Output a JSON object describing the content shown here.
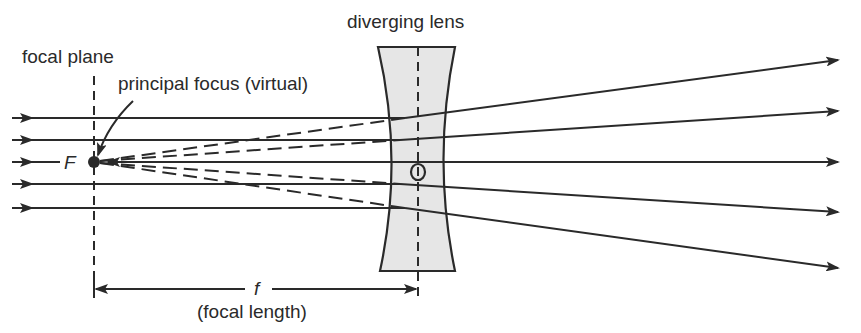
{
  "diagram": {
    "labels": {
      "focal_plane": "focal plane",
      "principal_focus": "principal focus (virtual)",
      "lens": "diverging lens",
      "focus_point": "F",
      "optical_centre": "O",
      "focal_length_symbol": "f",
      "focal_length_caption": "(focal length)"
    },
    "colors": {
      "line": "#2a2a2a",
      "lens_fill": "#e6e6e6",
      "background": "#ffffff"
    },
    "geometry": {
      "axis_y": 162,
      "focus_x": 93,
      "lens_center_x": 418,
      "incoming_ray_y": [
        118,
        140,
        162,
        184,
        208
      ],
      "outgoing_ray_end_y": [
        60,
        111,
        162,
        212,
        268
      ],
      "ray_start_x": 12,
      "ray_end_x": 840
    }
  }
}
